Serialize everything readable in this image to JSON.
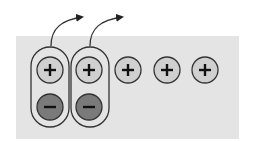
{
  "diagram": {
    "title": "",
    "colors": {
      "background": "#ffffff",
      "panel": "#e4e4e4",
      "positive_fill": "#d0d0d0",
      "negative_fill": "#7a7a7a",
      "stroke": "#333333"
    },
    "positive_charges": [
      {
        "cx": 50,
        "cy": 70,
        "symbol": "+",
        "paired": true
      },
      {
        "cx": 89,
        "cy": 70,
        "symbol": "+",
        "paired": true
      },
      {
        "cx": 128,
        "cy": 70,
        "symbol": "+",
        "paired": false
      },
      {
        "cx": 167,
        "cy": 70,
        "symbol": "+",
        "paired": false
      },
      {
        "cx": 205,
        "cy": 70,
        "symbol": "+",
        "paired": false
      }
    ],
    "negative_charges": [
      {
        "cx": 50,
        "cy": 107,
        "symbol": "−"
      },
      {
        "cx": 89,
        "cy": 107,
        "symbol": "−"
      }
    ],
    "pairs": 2,
    "arrows": 2
  }
}
